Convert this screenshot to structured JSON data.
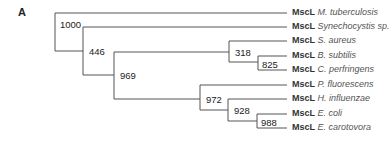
{
  "figure": {
    "panel_label": "A",
    "type": "phylogenetic-tree",
    "gene": "MscL",
    "leaves": [
      {
        "gene": "MscL",
        "species": "M. tuberculosis"
      },
      {
        "gene": "MscL",
        "species": "Synechocystis sp."
      },
      {
        "gene": "MscL",
        "species": "S. aureus"
      },
      {
        "gene": "MscL",
        "species": "B. subtilis"
      },
      {
        "gene": "MscL",
        "species": "C. perfringens"
      },
      {
        "gene": "MscL",
        "species": "P. fluorescens"
      },
      {
        "gene": "MscL",
        "species": "H. influenzae"
      },
      {
        "gene": "MscL",
        "species": "E. coli"
      },
      {
        "gene": "MscL",
        "species": "E. carotovora"
      }
    ],
    "bootstrap_values": {
      "root": "1000",
      "n446": "446",
      "n969": "969",
      "n318": "318",
      "n825": "825",
      "n972": "972",
      "n928": "928",
      "n988": "988"
    },
    "line_color": "#555555"
  }
}
